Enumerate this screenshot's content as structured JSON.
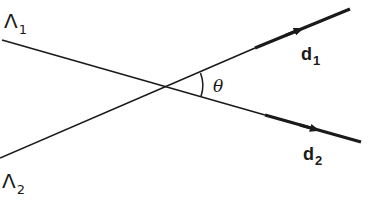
{
  "diagram": {
    "lines": [
      {
        "id": "line-1",
        "label": "Λ",
        "label_subscript": "1",
        "direction_label": "d",
        "direction_subscript": "1"
      },
      {
        "id": "line-2",
        "label": "Λ",
        "label_subscript": "2",
        "direction_label": "d",
        "direction_subscript": "2"
      }
    ],
    "angle": {
      "symbol": "θ"
    },
    "colors": {
      "stroke": "#1a1a1a",
      "background": "#ffffff"
    }
  }
}
